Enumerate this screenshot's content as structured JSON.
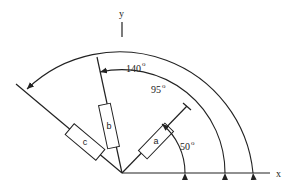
{
  "axes": {
    "x_label": "x",
    "y_label": "y"
  },
  "angles": [
    {
      "value": "50",
      "unit": "o",
      "label_text": "50"
    },
    {
      "value": "95",
      "unit": "o",
      "label_text": "95"
    },
    {
      "value": "140",
      "unit": "o",
      "label_text": "140"
    }
  ],
  "components": [
    {
      "label": "a"
    },
    {
      "label": "b"
    },
    {
      "label": "c"
    }
  ],
  "colors": {
    "stroke": "#222222",
    "background": "#ffffff"
  }
}
